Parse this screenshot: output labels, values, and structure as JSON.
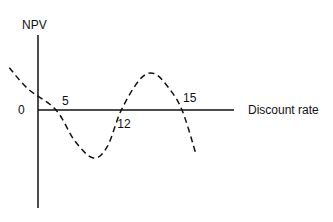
{
  "chart_data": {
    "type": "line",
    "title": "",
    "ylabel": "NPV",
    "xlabel": "Discount rate",
    "zero_label": "0",
    "grid": false,
    "legend": "none",
    "xlim": [
      0,
      22
    ],
    "ylim": [
      -6,
      6
    ],
    "series": [
      {
        "name": "NPV curve",
        "style": "dashed",
        "x": [
          0,
          2,
          5,
          7,
          9,
          10.5,
          12,
          14,
          15.5,
          17,
          18.5,
          20
        ],
        "y": [
          4.4,
          2.2,
          0,
          -3.2,
          -5.0,
          -3.8,
          0,
          3.2,
          3.8,
          2.4,
          0,
          -4.6
        ]
      }
    ],
    "annotations": [
      {
        "text": "5",
        "x": 5,
        "position": "above"
      },
      {
        "text": "12",
        "x": 12,
        "position": "below"
      },
      {
        "text": "15",
        "x": 18.5,
        "position": "above"
      }
    ]
  }
}
